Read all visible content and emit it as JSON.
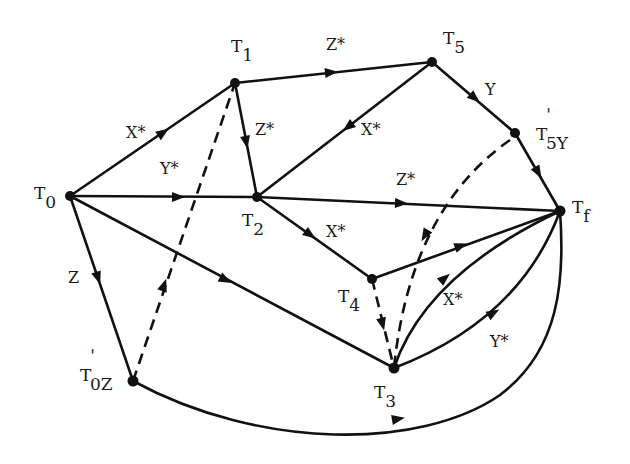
{
  "diagram": {
    "nodes": {
      "T0": {
        "main": "T",
        "sub": "0"
      },
      "T1": {
        "main": "T",
        "sub": "1"
      },
      "T2": {
        "main": "T",
        "sub": "2"
      },
      "T3": {
        "main": "T",
        "sub": "3"
      },
      "T4": {
        "main": "T",
        "sub": "4"
      },
      "T5": {
        "main": "T",
        "sub": "5"
      },
      "Tf": {
        "main": "T",
        "sub": "f"
      },
      "T5Y": {
        "main": "T",
        "prime": "'",
        "sub": "5Y"
      },
      "T0Z": {
        "main": "T",
        "prime": "'",
        "sub": "0Z"
      }
    },
    "edges": {
      "T0_T1": {
        "label": "X*",
        "style": "solid"
      },
      "T0_T2": {
        "label": "Y*",
        "style": "solid"
      },
      "T0_T0Z": {
        "label": "Z",
        "style": "solid"
      },
      "T0_T3": {
        "label": "",
        "style": "solid"
      },
      "T1_T5": {
        "label": "Z*",
        "style": "solid"
      },
      "T1_T2": {
        "label": "Z*",
        "style": "solid"
      },
      "T5_T2": {
        "label": "X*",
        "style": "solid"
      },
      "T5_T5Y": {
        "label": "Y",
        "style": "solid"
      },
      "T5Y_Tf": {
        "label": "",
        "style": "solid"
      },
      "T2_Tf": {
        "label": "Z*",
        "style": "solid"
      },
      "T2_T4": {
        "label": "X*",
        "style": "solid"
      },
      "T4_Tf": {
        "label": "",
        "style": "solid"
      },
      "T3_Tf_X": {
        "label": "X*",
        "style": "solid"
      },
      "T3_Tf_Y": {
        "label": "Y*",
        "style": "solid"
      },
      "T0Z_Tf": {
        "label": "",
        "style": "solid"
      },
      "T0Z_T1": {
        "label": "",
        "style": "dashed"
      },
      "T5Y_T3": {
        "label": "",
        "style": "dashed"
      },
      "T4_T3": {
        "label": "",
        "style": "dashed"
      }
    }
  }
}
